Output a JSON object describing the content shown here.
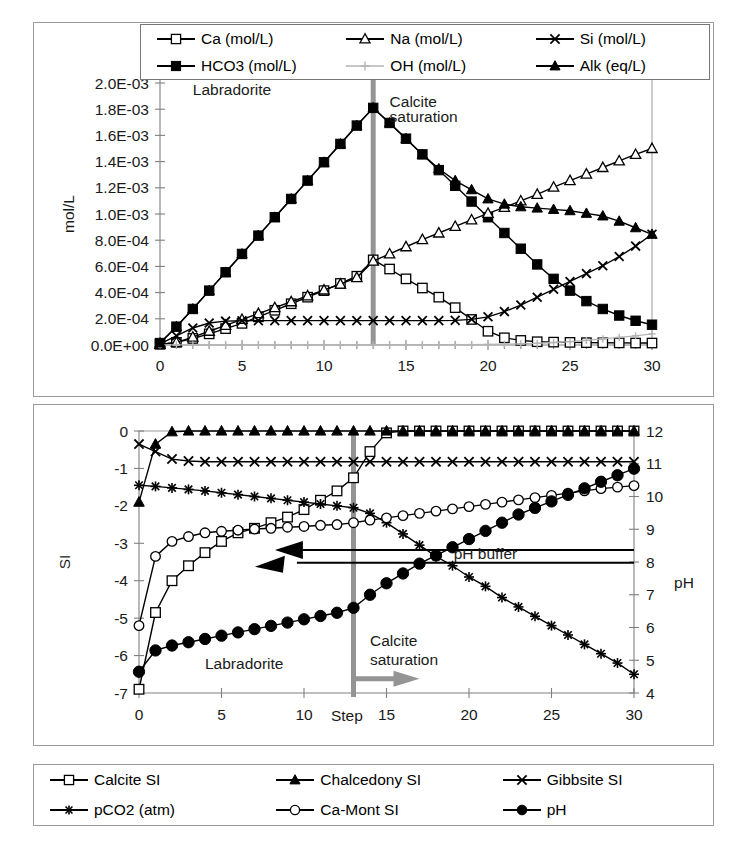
{
  "chart_data": [
    {
      "id": "top",
      "type": "line",
      "title": "",
      "xlabel": "",
      "ylabel": "mol/L",
      "xlim": [
        0,
        30
      ],
      "ylim": [
        0,
        0.002
      ],
      "xticks": [
        0,
        5,
        10,
        15,
        20,
        25,
        30
      ],
      "yticks": [
        0,
        0.0002,
        0.0004,
        0.0006,
        0.0008,
        0.001,
        0.0012,
        0.0014,
        0.0016,
        0.0018,
        0.002
      ],
      "ytick_labels": [
        "0.0E+00",
        "2.0E-04",
        "4.0E-04",
        "6.0E-04",
        "8.0E-04",
        "1.0E-03",
        "1.2E-03",
        "1.4E-03",
        "1.6E-03",
        "1.8E-03",
        "2.0E-03"
      ],
      "xtick_labels": [
        "0",
        "5",
        "10",
        "15",
        "20",
        "25",
        "30"
      ],
      "grid": false,
      "legend_position": "top",
      "annotations": [
        {
          "text": "Labradorite",
          "x": 2.0,
          "y": 0.00191
        },
        {
          "text": "Calcite",
          "x": 14.0,
          "y": 0.00182
        },
        {
          "text": "saturation",
          "x": 14.0,
          "y": 0.0017
        }
      ],
      "marker_line": {
        "label": "calcite-saturation",
        "x": 13,
        "color": "#949494"
      },
      "x": [
        0,
        1,
        2,
        3,
        4,
        5,
        6,
        7,
        8,
        9,
        10,
        11,
        12,
        13,
        14,
        15,
        16,
        17,
        18,
        19,
        20,
        21,
        22,
        23,
        24,
        25,
        26,
        27,
        28,
        29,
        30
      ],
      "series": [
        {
          "name": "Ca (mol/L)",
          "marker": "open-square",
          "values": [
            5e-06,
            2e-05,
            5e-05,
            8.5e-05,
            0.000125,
            0.000165,
            0.000215,
            0.000265,
            0.000315,
            0.000365,
            0.000415,
            0.00047,
            0.000525,
            0.00065,
            0.00058,
            0.000505,
            0.000435,
            0.000365,
            0.000285,
            0.000195,
            0.000105,
            5.5e-05,
            3.5e-05,
            2.5e-05,
            2.2e-05,
            2e-05,
            1.8e-05,
            1.7e-05,
            1.6e-05,
            1.5e-05,
            1.5e-05
          ]
        },
        {
          "name": "HCO3 (mol/L)",
          "marker": "filled-square",
          "values": [
            1.5e-05,
            0.00014,
            0.000275,
            0.000415,
            0.000555,
            0.000695,
            0.000835,
            0.000975,
            0.001115,
            0.001255,
            0.001395,
            0.001535,
            0.001675,
            0.00181,
            0.001695,
            0.001575,
            0.001455,
            0.001335,
            0.001215,
            0.001095,
            0.000975,
            0.000855,
            0.000735,
            0.000615,
            0.000505,
            0.000415,
            0.000335,
            0.000275,
            0.000225,
            0.000185,
            0.000155
          ]
        },
        {
          "name": "Na (mol/L)",
          "marker": "open-triangle",
          "values": [
            4e-06,
            2e-05,
            6e-05,
            0.000105,
            0.00015,
            0.000195,
            0.00024,
            0.000285,
            0.00033,
            0.000375,
            0.00042,
            0.000465,
            0.000515,
            0.00064,
            0.000695,
            0.00075,
            0.000805,
            0.000855,
            0.000905,
            0.000955,
            0.001005,
            0.00105,
            0.0011,
            0.00115,
            0.001205,
            0.001255,
            0.001305,
            0.001355,
            0.001405,
            0.001455,
            0.0015
          ]
        },
        {
          "name": "Si (mol/L)",
          "marker": "cross-x",
          "values": [
            8e-06,
            7e-05,
            0.00013,
            0.000168,
            0.000182,
            0.000185,
            0.000186,
            0.000186,
            0.000186,
            0.000186,
            0.000186,
            0.000186,
            0.000186,
            0.000186,
            0.000186,
            0.000186,
            0.000186,
            0.000186,
            0.000188,
            0.000196,
            0.000215,
            0.000255,
            0.000305,
            0.000365,
            0.000425,
            0.000485,
            0.000545,
            0.000605,
            0.000675,
            0.000755,
            0.000845
          ]
        },
        {
          "name": "OH (mol/L)",
          "marker": "plus",
          "color": "#b4b4b4",
          "values": [
            1e-06,
            1e-06,
            1e-06,
            1e-06,
            1e-06,
            1e-06,
            1e-06,
            1e-06,
            1e-06,
            1e-06,
            1e-06,
            1e-06,
            1e-06,
            2e-06,
            2e-06,
            2e-06,
            2e-06,
            2e-06,
            3e-06,
            3e-06,
            4e-06,
            6e-06,
            9e-06,
            1.3e-05,
            1.9e-05,
            2.6e-05,
            3.5e-05,
            4.6e-05,
            5.8e-05,
            7e-05,
            8.5e-05
          ]
        },
        {
          "name": "Alk (eq/L)",
          "marker": "filled-triangle",
          "values": [
            1.5e-05,
            0.00014,
            0.000275,
            0.000415,
            0.000555,
            0.000695,
            0.000835,
            0.000975,
            0.001115,
            0.001255,
            0.001395,
            0.001535,
            0.001675,
            0.00181,
            0.001695,
            0.001575,
            0.001455,
            0.001345,
            0.001255,
            0.001185,
            0.001115,
            0.001075,
            0.001055,
            0.001045,
            0.001035,
            0.001025,
            0.001005,
            0.000985,
            0.000945,
            0.000895,
            0.000845
          ]
        }
      ]
    },
    {
      "id": "bottom",
      "type": "line",
      "title": "",
      "xlabel": "Step",
      "ylabel": "SI",
      "ylabel_right": "pH",
      "xlim": [
        0,
        30
      ],
      "ylim": [
        -7,
        0
      ],
      "ylim_right": [
        4,
        12
      ],
      "xticks": [
        0,
        5,
        10,
        15,
        20,
        25,
        30
      ],
      "yticks": [
        -7,
        -6,
        -5,
        -4,
        -3,
        -2,
        -1,
        0
      ],
      "ytick_labels": [
        "-7",
        "-6",
        "-5",
        "-4",
        "-3",
        "-2",
        "-1",
        "0"
      ],
      "yticks_right": [
        4,
        5,
        6,
        7,
        8,
        9,
        10,
        11,
        12
      ],
      "ytick_labels_right": [
        "4",
        "5",
        "6",
        "7",
        "8",
        "9",
        "10",
        "11",
        "12"
      ],
      "xtick_labels": [
        "0",
        "5",
        "10",
        "15",
        "20",
        "25",
        "30"
      ],
      "grid": false,
      "legend_position": "bottom",
      "annotations": [
        {
          "text": "Labradorite",
          "x": 4.0,
          "y": -6.35
        },
        {
          "text": "Calcite",
          "x": 14.0,
          "y": -5.75
        },
        {
          "text": "saturation",
          "x": 14.0,
          "y": -6.25
        },
        {
          "text": "pH buffer",
          "x": 21.0,
          "y": -3.35
        }
      ],
      "marker_line": {
        "label": "calcite-saturation",
        "x": 13,
        "color": "#949494"
      },
      "x": [
        0,
        1,
        2,
        3,
        4,
        5,
        6,
        7,
        8,
        9,
        10,
        11,
        12,
        13,
        14,
        15,
        16,
        17,
        18,
        19,
        20,
        21,
        22,
        23,
        24,
        25,
        26,
        27,
        28,
        29,
        30
      ],
      "series": [
        {
          "name": "Calcite SI",
          "marker": "open-square",
          "axis": "left",
          "values": [
            -6.9,
            -4.85,
            -4.0,
            -3.6,
            -3.25,
            -2.95,
            -2.72,
            -2.6,
            -2.45,
            -2.3,
            -2.1,
            -1.85,
            -1.6,
            -1.25,
            -0.55,
            -0.05,
            0,
            0,
            0,
            0,
            0,
            0,
            0,
            0,
            0,
            0,
            0,
            0,
            0,
            0,
            0
          ]
        },
        {
          "name": "Chalcedony SI",
          "marker": "filled-triangle",
          "axis": "left",
          "values": [
            -1.9,
            -0.35,
            -0.02,
            0,
            0,
            0,
            0,
            0,
            0,
            0,
            0,
            0,
            0,
            0,
            0,
            0,
            0,
            0,
            0,
            0,
            0,
            0,
            0,
            0,
            0,
            0,
            0,
            0,
            0,
            0,
            0
          ]
        },
        {
          "name": "Gibbsite SI",
          "marker": "cross-x",
          "axis": "left",
          "values": [
            -0.35,
            -0.55,
            -0.75,
            -0.8,
            -0.82,
            -0.82,
            -0.82,
            -0.82,
            -0.82,
            -0.82,
            -0.82,
            -0.82,
            -0.82,
            -0.82,
            -0.82,
            -0.82,
            -0.82,
            -0.82,
            -0.82,
            -0.82,
            -0.82,
            -0.82,
            -0.82,
            -0.82,
            -0.82,
            -0.82,
            -0.82,
            -0.82,
            -0.82,
            -0.82,
            -0.82
          ]
        },
        {
          "name": "pCO2 (atm)",
          "marker": "star-asterisk",
          "axis": "left",
          "values": [
            -1.45,
            -1.48,
            -1.52,
            -1.56,
            -1.6,
            -1.65,
            -1.7,
            -1.75,
            -1.8,
            -1.85,
            -1.9,
            -1.95,
            -2.0,
            -2.05,
            -2.2,
            -2.45,
            -2.75,
            -3.05,
            -3.35,
            -3.6,
            -3.9,
            -4.15,
            -4.45,
            -4.7,
            -4.95,
            -5.2,
            -5.45,
            -5.7,
            -5.95,
            -6.2,
            -6.5
          ]
        },
        {
          "name": "Ca-Mont SI",
          "marker": "open-circle",
          "axis": "left",
          "values": [
            -5.2,
            -3.35,
            -2.95,
            -2.82,
            -2.72,
            -2.68,
            -2.65,
            -2.62,
            -2.6,
            -2.57,
            -2.55,
            -2.52,
            -2.5,
            -2.45,
            -2.38,
            -2.32,
            -2.26,
            -2.2,
            -2.14,
            -2.08,
            -2.02,
            -1.96,
            -1.9,
            -1.84,
            -1.78,
            -1.72,
            -1.66,
            -1.6,
            -1.54,
            -1.5,
            -1.46
          ]
        },
        {
          "name": "pH",
          "marker": "filled-circle",
          "axis": "right",
          "values": [
            4.65,
            5.3,
            5.45,
            5.55,
            5.65,
            5.75,
            5.85,
            5.95,
            6.05,
            6.15,
            6.25,
            6.35,
            6.45,
            6.6,
            7.0,
            7.35,
            7.65,
            7.95,
            8.2,
            8.45,
            8.7,
            8.95,
            9.2,
            9.45,
            9.65,
            9.85,
            10.05,
            10.25,
            10.45,
            10.65,
            10.85
          ]
        }
      ]
    }
  ],
  "legend_top": {
    "items": [
      {
        "label": "Ca (mol/L)",
        "marker": "open-square"
      },
      {
        "label": "Na (mol/L)",
        "marker": "open-triangle"
      },
      {
        "label": "Si (mol/L)",
        "marker": "cross-x"
      },
      {
        "label": "HCO3 (mol/L)",
        "marker": "filled-square"
      },
      {
        "label": "OH (mol/L)",
        "marker": "plus"
      },
      {
        "label": "Alk (eq/L)",
        "marker": "filled-triangle"
      }
    ]
  },
  "legend_bottom": {
    "items": [
      {
        "label": "Calcite SI",
        "marker": "open-square"
      },
      {
        "label": "Chalcedony SI",
        "marker": "filled-triangle"
      },
      {
        "label": "Gibbsite SI",
        "marker": "cross-x"
      },
      {
        "label": "pCO2 (atm)",
        "marker": "star-asterisk"
      },
      {
        "label": "Ca-Mont SI",
        "marker": "open-circle"
      },
      {
        "label": "pH",
        "marker": "filled-circle"
      }
    ]
  },
  "colors": {
    "axis": "#808080",
    "series": "#000000",
    "oh_gray": "#b4b4b4",
    "saturation_line": "#949494",
    "frame": "#9a9a9a"
  }
}
